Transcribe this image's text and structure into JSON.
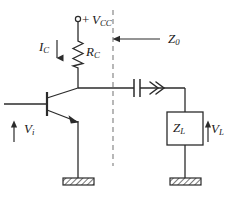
{
  "diagram": {
    "line_color": "#2b2b2b",
    "dash_color": "#9a9a9a",
    "text_color": "#1a1a1a",
    "background": "#ffffff"
  },
  "labels": {
    "supply": {
      "sign": "+",
      "symbol": "V",
      "subscript": "CC",
      "text": "+ VCC"
    },
    "collector_current": {
      "symbol": "I",
      "subscript": "C",
      "text": "IC"
    },
    "collector_resistor": {
      "symbol": "R",
      "subscript": "C",
      "text": "RC"
    },
    "reference_impedance": {
      "symbol": "Z",
      "subscript": "0",
      "text": "Z0"
    },
    "input_voltage": {
      "symbol": "V",
      "subscript": "i",
      "text": "Vi"
    },
    "load_impedance": {
      "symbol": "Z",
      "subscript": "L",
      "text": "ZL"
    },
    "load_voltage": {
      "symbol": "V",
      "subscript": "L",
      "text": "VL"
    }
  },
  "components": {
    "supply_terminal": "open-circle-terminal",
    "resistor": "zigzag-resistor",
    "transistor": "npn-bjt",
    "capacitor": "coupling-capacitor",
    "signal_arrow": "double-chevron-right",
    "load": "impedance-box",
    "grounds": [
      "hatched-ground-left",
      "hatched-ground-right"
    ],
    "reference_plane": "vertical-dashed-line"
  }
}
